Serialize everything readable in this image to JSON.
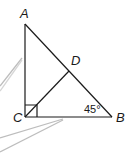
{
  "diagram": {
    "type": "geometry-triangle",
    "vertices": {
      "A": {
        "label": "A"
      },
      "B": {
        "label": "B"
      },
      "C": {
        "label": "C"
      },
      "D": {
        "label": "D"
      }
    },
    "angle_label": "45°",
    "right_angle_at": "C",
    "segments": [
      "AC",
      "CB",
      "AB",
      "CD"
    ],
    "colors": {
      "line": "#1a1a1a",
      "callout": "#b8b8b8",
      "background": "#ffffff"
    }
  }
}
